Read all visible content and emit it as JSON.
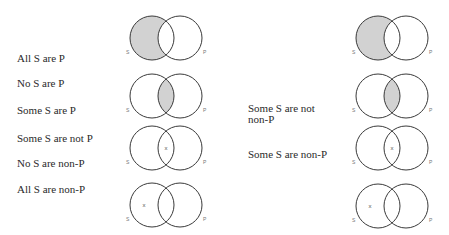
{
  "left_column": {
    "propositions": [
      {
        "text": "All S are P",
        "x": 17,
        "y": 53
      },
      {
        "text": "No S are P",
        "x": 17,
        "y": 78
      },
      {
        "text": "Some S are P",
        "x": 17,
        "y": 105
      },
      {
        "text": "Some S are not P",
        "x": 17,
        "y": 133
      },
      {
        "text": "No S are non-P",
        "x": 17,
        "y": 158
      },
      {
        "text": "All S are non-P",
        "x": 17,
        "y": 184
      }
    ],
    "diagrams": [
      {
        "cy": 38,
        "shade": "s-only",
        "mark": null
      },
      {
        "cy": 96,
        "shade": "lens",
        "mark": null
      },
      {
        "cy": 148,
        "shade": null,
        "mark": "lens"
      },
      {
        "cy": 205,
        "shade": null,
        "mark": "s-only"
      }
    ],
    "s_cx": 152,
    "p_cx": 180
  },
  "right_column": {
    "propositions": [
      {
        "text": "Some S are not",
        "x": 248,
        "y": 103
      },
      {
        "text": "non-P",
        "x": 248,
        "y": 114
      },
      {
        "text": "Some S are non-P",
        "x": 248,
        "y": 149
      }
    ],
    "diagrams": [
      {
        "cy": 38,
        "shade": "s-only",
        "mark": null
      },
      {
        "cy": 96,
        "shade": "lens",
        "mark": null
      },
      {
        "cy": 148,
        "shade": null,
        "mark": "lens"
      },
      {
        "cy": 206,
        "shade": null,
        "mark": "s-only"
      }
    ],
    "s_cx": 378,
    "p_cx": 406
  },
  "circle_radius": 22,
  "labels": {
    "s": "S",
    "p": "P",
    "existence_mark": "x"
  },
  "colors": {
    "shade": "#d2d2d2",
    "stroke": "#3a3a3a",
    "text": "#2a2a2a"
  }
}
